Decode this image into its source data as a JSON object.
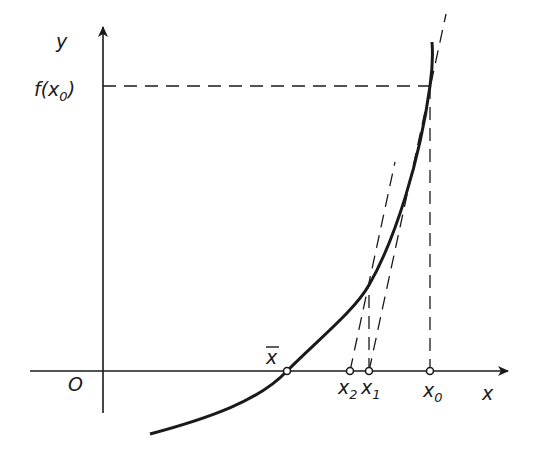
{
  "diagram": {
    "axes": {
      "x_label": "x",
      "y_label": "y",
      "origin_label": "O"
    },
    "labels": {
      "f_x0": {
        "base": "f(x",
        "sub": "0",
        "close": ")"
      },
      "x_bar": "x",
      "x0": {
        "base": "x",
        "sub": "0"
      },
      "x1": {
        "base": "x",
        "sub": "1"
      },
      "x2": {
        "base": "x",
        "sub": "2"
      }
    },
    "points": {
      "x_bar": [
        287,
        371
      ],
      "x2": [
        350,
        371
      ],
      "x1": [
        369,
        371
      ],
      "x0": [
        430,
        371
      ],
      "curve_at_x1": [
        369,
        285
      ],
      "curve_at_x0": [
        430,
        86
      ]
    },
    "colors": {
      "line": "#1a1a1a",
      "background": "#ffffff"
    }
  }
}
